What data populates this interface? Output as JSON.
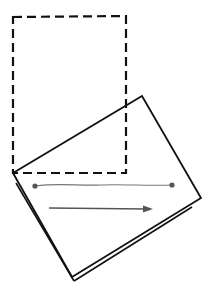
{
  "diagram": {
    "colors": {
      "outline": "#111111",
      "segment": "#777777",
      "arrow": "#555555",
      "background": "#ffffff"
    },
    "original_rectangle": {
      "style": "dashed",
      "points": "13,17 126,16 126,173 13,173"
    },
    "rotated_rectangle": {
      "style": "solid",
      "points": "13,173 142,96 201,198 72,277",
      "thickness_edges": [
        "left-bottom",
        "bottom-right"
      ]
    },
    "segment": {
      "start": [
        35,
        186
      ],
      "end": [
        172,
        185
      ]
    },
    "arrow": {
      "start": [
        49,
        208
      ],
      "end": [
        152,
        209
      ]
    }
  }
}
